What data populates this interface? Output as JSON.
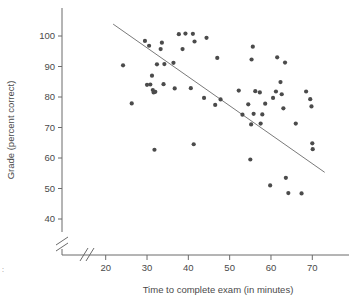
{
  "chart_data": {
    "type": "scatter",
    "title": "",
    "xlabel": "Time to complete exam (in minutes)",
    "ylabel": "Grade (percent correct)",
    "xlim": [
      18,
      75
    ],
    "ylim": [
      36,
      105
    ],
    "xticks": [
      20,
      30,
      40,
      50,
      60,
      70
    ],
    "yticks": [
      40,
      50,
      60,
      70,
      80,
      90,
      100
    ],
    "grid": false,
    "legend": null,
    "axis_break_x": true,
    "axis_break_y": true,
    "trendline": {
      "name": "least-squares regression line",
      "x_start": 21.8,
      "y_start": 103.9,
      "x_end": 73.0,
      "y_end": 55.3
    },
    "points": [
      {
        "x": 24.2,
        "y": 90.4
      },
      {
        "x": 26.3,
        "y": 77.9
      },
      {
        "x": 29.5,
        "y": 98.4
      },
      {
        "x": 30.0,
        "y": 84.0
      },
      {
        "x": 30.8,
        "y": 84.1
      },
      {
        "x": 30.5,
        "y": 96.8
      },
      {
        "x": 31.2,
        "y": 87.0
      },
      {
        "x": 31.4,
        "y": 82.3
      },
      {
        "x": 31.6,
        "y": 81.5
      },
      {
        "x": 32.0,
        "y": 81.7
      },
      {
        "x": 31.8,
        "y": 62.7
      },
      {
        "x": 32.4,
        "y": 90.7
      },
      {
        "x": 33.3,
        "y": 95.7
      },
      {
        "x": 33.6,
        "y": 97.8
      },
      {
        "x": 34.0,
        "y": 84.2
      },
      {
        "x": 34.2,
        "y": 90.8
      },
      {
        "x": 36.4,
        "y": 91.2
      },
      {
        "x": 36.7,
        "y": 82.8
      },
      {
        "x": 37.7,
        "y": 100.6
      },
      {
        "x": 38.6,
        "y": 95.7
      },
      {
        "x": 39.3,
        "y": 100.8
      },
      {
        "x": 40.6,
        "y": 82.9
      },
      {
        "x": 41.1,
        "y": 100.7
      },
      {
        "x": 41.5,
        "y": 98.2
      },
      {
        "x": 41.3,
        "y": 64.5
      },
      {
        "x": 43.8,
        "y": 79.7
      },
      {
        "x": 44.4,
        "y": 99.4
      },
      {
        "x": 46.5,
        "y": 77.4
      },
      {
        "x": 47.0,
        "y": 92.8
      },
      {
        "x": 47.8,
        "y": 79.2
      },
      {
        "x": 52.2,
        "y": 82.1
      },
      {
        "x": 53.1,
        "y": 74.2
      },
      {
        "x": 54.5,
        "y": 77.6
      },
      {
        "x": 55.3,
        "y": 92.3
      },
      {
        "x": 55.6,
        "y": 96.5
      },
      {
        "x": 55.2,
        "y": 71.0
      },
      {
        "x": 55.0,
        "y": 59.5
      },
      {
        "x": 55.8,
        "y": 74.5
      },
      {
        "x": 56.2,
        "y": 81.9
      },
      {
        "x": 57.3,
        "y": 81.5
      },
      {
        "x": 57.5,
        "y": 71.3
      },
      {
        "x": 57.9,
        "y": 74.3
      },
      {
        "x": 58.6,
        "y": 77.8
      },
      {
        "x": 59.8,
        "y": 51.0
      },
      {
        "x": 60.5,
        "y": 79.7
      },
      {
        "x": 61.2,
        "y": 81.8
      },
      {
        "x": 61.5,
        "y": 93.0
      },
      {
        "x": 62.3,
        "y": 84.9
      },
      {
        "x": 62.6,
        "y": 80.9
      },
      {
        "x": 63.0,
        "y": 76.3
      },
      {
        "x": 63.4,
        "y": 91.3
      },
      {
        "x": 63.6,
        "y": 53.5
      },
      {
        "x": 64.2,
        "y": 48.5
      },
      {
        "x": 66.0,
        "y": 71.3
      },
      {
        "x": 67.4,
        "y": 48.4
      },
      {
        "x": 68.5,
        "y": 81.8
      },
      {
        "x": 69.5,
        "y": 79.3
      },
      {
        "x": 69.8,
        "y": 76.9
      },
      {
        "x": 70.0,
        "y": 64.8
      },
      {
        "x": 70.1,
        "y": 62.9
      }
    ]
  },
  "figure": {
    "corner_mark": ":"
  }
}
